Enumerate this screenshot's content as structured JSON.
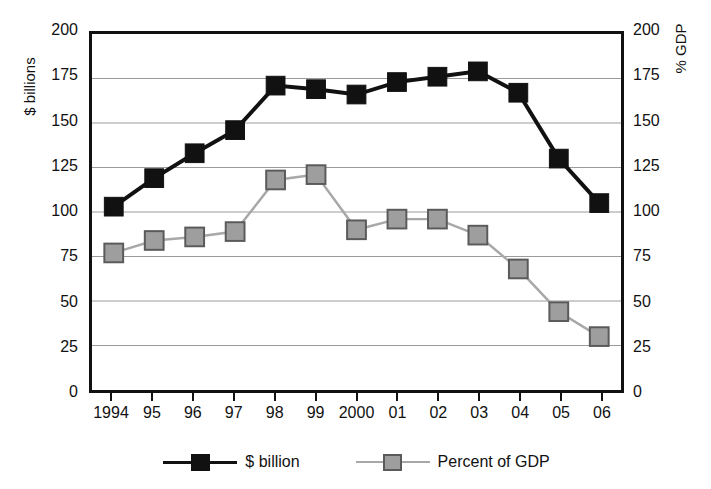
{
  "chart_data": {
    "type": "line",
    "title": "",
    "subtitle": "",
    "xlabel": "",
    "ylabel": "$ billions",
    "y2label": "% GDP",
    "categories": [
      "1994",
      "95",
      "96",
      "97",
      "98",
      "99",
      "2000",
      "01",
      "02",
      "03",
      "04",
      "05",
      "06"
    ],
    "ylim": [
      0,
      200
    ],
    "y2lim": [
      0,
      200
    ],
    "yticks": [
      0,
      25,
      50,
      75,
      100,
      125,
      150,
      175,
      200
    ],
    "y2ticks": [
      0,
      25,
      50,
      75,
      100,
      125,
      150,
      175,
      200
    ],
    "ytick_labels": [
      "0",
      "25",
      "50",
      "75",
      "100",
      "125",
      "150",
      "175",
      "200"
    ],
    "y2tick_labels": [
      "0",
      "25",
      "50",
      "75",
      "100",
      "125",
      "150",
      "175",
      "200"
    ],
    "grid": true,
    "grid_axis": "y",
    "legend_position": "bottom",
    "series": [
      {
        "name": "$ billion",
        "axis": "left",
        "color": "#111111",
        "marker": "square",
        "marker_color": "#111111",
        "values": [
          103,
          119,
          133,
          146,
          171,
          169,
          166,
          173,
          176,
          179,
          167,
          130,
          105
        ]
      },
      {
        "name": "Percent of GDP",
        "axis": "right",
        "color": "#a8a8a8",
        "marker": "square",
        "marker_color": "#9e9e9e",
        "values": [
          77,
          84,
          86,
          89,
          118,
          121,
          90,
          96,
          96,
          87,
          68,
          44,
          30
        ]
      }
    ]
  },
  "legend": {
    "entries": [
      {
        "label": "$ billion"
      },
      {
        "label": "Percent of GDP"
      }
    ]
  },
  "colors": {
    "series_a": "#111111",
    "series_b": "#9e9e9e",
    "grid": "#9b9b9b",
    "frame": "#111111",
    "background": "#ffffff"
  }
}
